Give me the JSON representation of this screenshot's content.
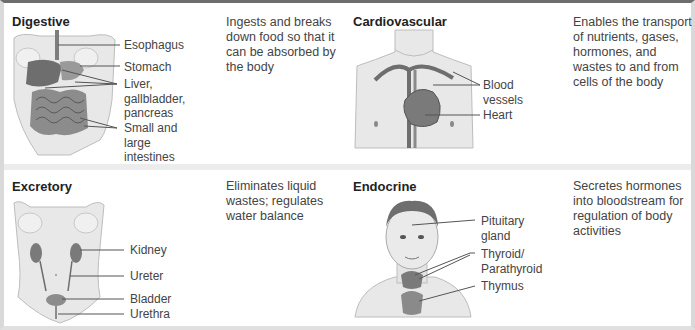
{
  "systems": [
    {
      "name": "Digestive",
      "description": "Ingests and breaks down food so that it can be absorbed by the body",
      "labels": [
        "Esophagus",
        "Stomach",
        "Liver, gallbladder, pancreas",
        "Small and large intestines"
      ],
      "label_lines": [
        [
          "Esophagus"
        ],
        [
          "Stomach"
        ],
        [
          "Liver,",
          "gallbladder,",
          "pancreas"
        ],
        [
          "Small and",
          "large",
          "intestines"
        ]
      ]
    },
    {
      "name": "Cardiovascular",
      "description": "Enables the transport of nutrients, gases, hormones, and wastes to and from cells of the body",
      "labels": [
        "Blood vessels",
        "Heart"
      ],
      "label_lines": [
        [
          "Blood",
          "vessels"
        ],
        [
          "Heart"
        ]
      ]
    },
    {
      "name": "Excretory",
      "description": "Eliminates liquid wastes; regulates water balance",
      "labels": [
        "Kidney",
        "Ureter",
        "Bladder",
        "Urethra"
      ],
      "label_lines": [
        [
          "Kidney"
        ],
        [
          "Ureter"
        ],
        [
          "Bladder"
        ],
        [
          "Urethra"
        ]
      ]
    },
    {
      "name": "Endocrine",
      "description": "Secretes hormones into bloodstream for regulation of body activities",
      "labels": [
        "Pituitary gland",
        "Thyroid/Parathyroid",
        "Thymus"
      ],
      "label_lines": [
        [
          "Pituitary",
          "gland"
        ],
        [
          "Thyroid/",
          "Parathyroid"
        ],
        [
          "Thymus"
        ]
      ]
    }
  ],
  "desc_lines": {
    "digestive": [
      "Ingests and breaks",
      "down food so that it",
      "can be absorbed by",
      "the body"
    ],
    "cardiovascular": [
      "Enables the transport",
      "of nutrients, gases,",
      "hormones, and",
      "wastes to and from",
      "cells of the body"
    ],
    "excretory": [
      "Eliminates liquid",
      "wastes; regulates",
      "water balance"
    ],
    "endocrine": [
      "Secretes hormones",
      "into bloodstream for",
      "regulation of body",
      "activities"
    ]
  },
  "colors": {
    "top_rule": "#6d6d6d",
    "border": "#d9d9d9",
    "skin": "#e6e6e6",
    "organ": "#8a8a8a",
    "organ_dark": "#5e5e5e"
  }
}
